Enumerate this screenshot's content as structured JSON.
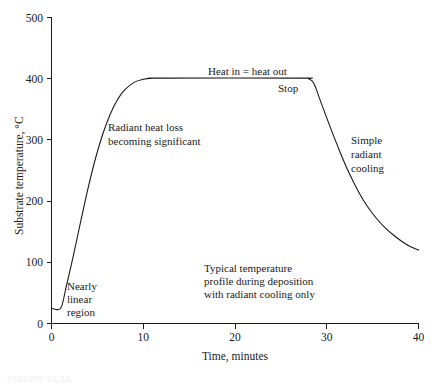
{
  "chart_data": {
    "type": "line",
    "title": "",
    "xlabel": "Time, minutes",
    "ylabel": "Substrate temperature, °C",
    "xlim": [
      0,
      40
    ],
    "ylim": [
      0,
      500
    ],
    "xticks": [
      0,
      10,
      20,
      30,
      40
    ],
    "yticks": [
      0,
      100,
      200,
      300,
      400,
      500
    ],
    "xticklabels": [
      "0",
      "10",
      "20",
      "30",
      "40"
    ],
    "yticklabels": [
      "0",
      "100",
      "200",
      "300",
      "400",
      "500"
    ],
    "grid": false,
    "legend": null,
    "series": [
      {
        "name": "Substrate temperature profile",
        "x": [
          0.0,
          1.0,
          1.6,
          2.4,
          3.2,
          4.0,
          4.8,
          5.6,
          6.4,
          7.2,
          8.0,
          9.0,
          10.0,
          11.0,
          12.0,
          27.0,
          28.0,
          28.6,
          29.4,
          30.4,
          31.4,
          32.4,
          33.4,
          34.4,
          35.4,
          36.4,
          37.4,
          38.4,
          39.2,
          40.0
        ],
        "y": [
          25,
          25,
          60,
          112,
          168,
          222,
          270,
          310,
          342,
          366,
          382,
          394,
          399,
          401,
          401,
          401,
          400,
          392,
          360,
          320,
          282,
          247,
          217,
          192,
          172,
          156,
          143,
          132,
          125,
          120
        ]
      }
    ],
    "annotations": [
      {
        "id": "radiant-heat-loss",
        "text": [
          "Radiant heat loss",
          "becoming significant"
        ],
        "x": 6.2,
        "y": 318
      },
      {
        "id": "heat-in-equals-heat-out",
        "text": [
          "Heat in = heat out"
        ],
        "x": 19.2,
        "y": 418
      },
      {
        "id": "stop",
        "text": [
          "Stop"
        ],
        "x": 25.6,
        "y": 392
      },
      {
        "id": "simple-radiant-cooling",
        "text": [
          "Simple",
          "radiant",
          "cooling"
        ],
        "x": 34.6,
        "y": 300
      },
      {
        "id": "nearly-linear-region",
        "text": [
          "Nearly",
          "linear",
          "region"
        ],
        "x": 2.0,
        "y": 92
      },
      {
        "id": "typical-temperature-profile",
        "text": [
          "Typical temperature",
          "profile during deposition",
          "with radiant cooling only"
        ],
        "x": 17.0,
        "y": 128
      }
    ]
  },
  "caption": {
    "label": "FIGURE 10.12"
  }
}
